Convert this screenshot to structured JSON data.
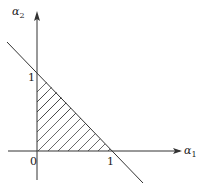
{
  "diagram": {
    "title": "",
    "axes": {
      "x": {
        "label": "α",
        "subscript": "1"
      },
      "y": {
        "label": "α",
        "subscript": "2"
      }
    },
    "ticks": {
      "origin": "0",
      "x_one": "1",
      "y_one": "1"
    },
    "line": {
      "equation": "α1 + α2 = 1"
    },
    "region": {
      "description": "hatched triangle α1 ≥ 0, α2 ≥ 0, α1 + α2 ≤ 1",
      "fill": "diagonal hatching"
    },
    "colors": {
      "stroke": "#333333",
      "background": "#ffffff"
    }
  }
}
